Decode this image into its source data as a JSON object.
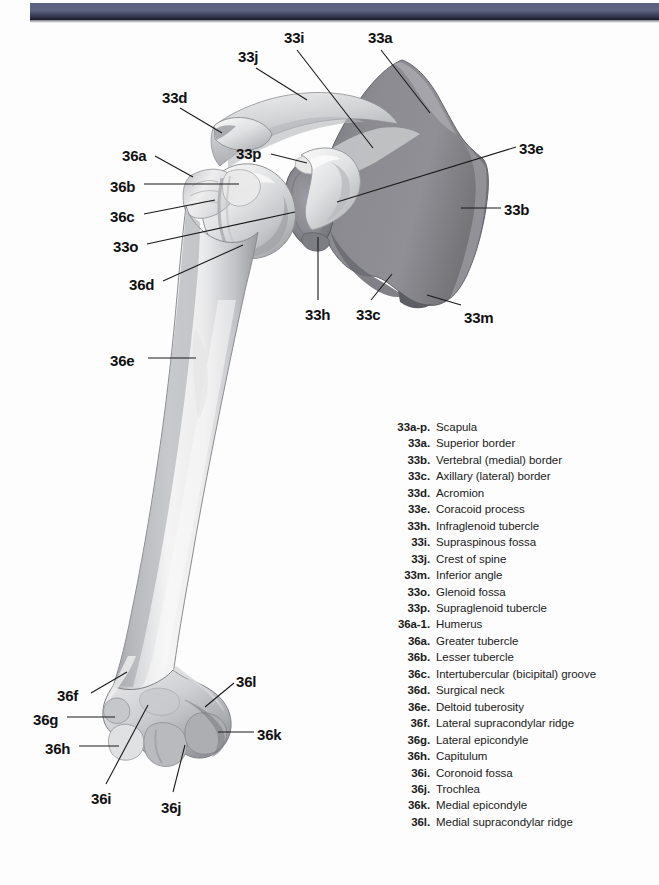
{
  "page": {
    "background_color": "#fdfdfd",
    "width": 659,
    "height": 885
  },
  "top_band": {
    "name": "decorative-header-band",
    "colors": [
      "#5b6180",
      "#3c4059",
      "#1b1d2c"
    ]
  },
  "figure": {
    "view": "Anterior view",
    "bone_colors": {
      "humerus_light": "#f2f2f2",
      "humerus_mid": "#d3d4d6",
      "humerus_shadow": "#9b9ca0",
      "scapula_body": "#86868c",
      "scapula_dark": "#6e6e76",
      "scapula_light": "#d8d8da",
      "outline": "#6a6a70"
    },
    "leader_line_color": "#1a1a1a"
  },
  "callouts": [
    {
      "code": "33i",
      "x": 284,
      "y": 30,
      "leader": [
        [
          297,
          50
        ],
        [
          373,
          148
        ]
      ]
    },
    {
      "code": "33a",
      "x": 368,
      "y": 30,
      "leader": [
        [
          381,
          50
        ],
        [
          430,
          113
        ]
      ]
    },
    {
      "code": "33j",
      "x": 238,
      "y": 49,
      "leader": [
        [
          256,
          68
        ],
        [
          307,
          100
        ]
      ]
    },
    {
      "code": "33d",
      "x": 162,
      "y": 90,
      "leader": [
        [
          180,
          108
        ],
        [
          222,
          133
        ]
      ]
    },
    {
      "code": "33e",
      "x": 519,
      "y": 141,
      "leader": [
        [
          516,
          147
        ],
        [
          337,
          202
        ]
      ]
    },
    {
      "code": "33p",
      "x": 236,
      "y": 146,
      "leader": [
        [
          271,
          154
        ],
        [
          307,
          163
        ]
      ]
    },
    {
      "code": "36a",
      "x": 122,
      "y": 148,
      "leader": [
        [
          155,
          156
        ],
        [
          193,
          177
        ]
      ]
    },
    {
      "code": "36b",
      "x": 110,
      "y": 179,
      "leader": [
        [
          144,
          184
        ],
        [
          239,
          184
        ]
      ]
    },
    {
      "code": "33b",
      "x": 504,
      "y": 202,
      "leader": [
        [
          501,
          208
        ],
        [
          461,
          208
        ]
      ]
    },
    {
      "code": "36c",
      "x": 110,
      "y": 209,
      "leader": [
        [
          144,
          214
        ],
        [
          215,
          200
        ]
      ]
    },
    {
      "code": "33o",
      "x": 113,
      "y": 239,
      "leader": [
        [
          147,
          244
        ],
        [
          295,
          212
        ]
      ]
    },
    {
      "code": "36d",
      "x": 129,
      "y": 277,
      "leader": [
        [
          163,
          281
        ],
        [
          243,
          245
        ]
      ]
    },
    {
      "code": "33h",
      "x": 305,
      "y": 307,
      "leader": [
        [
          318,
          300
        ],
        [
          318,
          237
        ]
      ]
    },
    {
      "code": "33c",
      "x": 356,
      "y": 307,
      "leader": [
        [
          371,
          300
        ],
        [
          392,
          274
        ]
      ]
    },
    {
      "code": "33m",
      "x": 464,
      "y": 310,
      "leader": [
        [
          461,
          305
        ],
        [
          427,
          295
        ]
      ]
    },
    {
      "code": "36e",
      "x": 110,
      "y": 353,
      "leader": [
        [
          148,
          358
        ],
        [
          196,
          358
        ]
      ]
    },
    {
      "code": "36l",
      "x": 236,
      "y": 674,
      "leader": [
        [
          234,
          683
        ],
        [
          205,
          707
        ]
      ]
    },
    {
      "code": "36f",
      "x": 57,
      "y": 688,
      "leader": [
        [
          91,
          693
        ],
        [
          127,
          672
        ]
      ]
    },
    {
      "code": "36g",
      "x": 33,
      "y": 712,
      "leader": [
        [
          67,
          717
        ],
        [
          115,
          717
        ]
      ]
    },
    {
      "code": "36k",
      "x": 257,
      "y": 727,
      "leader": [
        [
          254,
          732
        ],
        [
          218,
          732
        ]
      ]
    },
    {
      "code": "36h",
      "x": 45,
      "y": 741,
      "leader": [
        [
          79,
          746
        ],
        [
          119,
          746
        ]
      ]
    },
    {
      "code": "36i",
      "x": 91,
      "y": 791,
      "leader": [
        [
          106,
          784
        ],
        [
          148,
          705
        ]
      ]
    },
    {
      "code": "36j",
      "x": 161,
      "y": 800,
      "leader": [
        [
          173,
          792
        ],
        [
          185,
          745
        ]
      ]
    }
  ],
  "legend": {
    "entries": [
      {
        "code": "33a-p.",
        "term": "Scapula"
      },
      {
        "code": "33a.",
        "term": "Superior border"
      },
      {
        "code": "33b.",
        "term": "Vertebral (medial) border"
      },
      {
        "code": "33c.",
        "term": "Axillary (lateral) border"
      },
      {
        "code": "33d.",
        "term": "Acromion"
      },
      {
        "code": "33e.",
        "term": "Coracoid process"
      },
      {
        "code": "33h.",
        "term": "Infraglenoid tubercle"
      },
      {
        "code": "33i.",
        "term": "Supraspinous fossa"
      },
      {
        "code": "33j.",
        "term": "Crest of spine"
      },
      {
        "code": "33m.",
        "term": "Inferior angle"
      },
      {
        "code": "33o.",
        "term": "Glenoid fossa"
      },
      {
        "code": "33p.",
        "term": "Supraglenoid tubercle"
      },
      {
        "code": "36a-1.",
        "term": "Humerus"
      },
      {
        "code": "36a.",
        "term": "Greater tubercle"
      },
      {
        "code": "36b.",
        "term": "Lesser tubercle"
      },
      {
        "code": "36c.",
        "term": "Intertubercular (bicipital) groove"
      },
      {
        "code": "36d.",
        "term": "Surgical neck"
      },
      {
        "code": "36e.",
        "term": "Deltoid tuberosity"
      },
      {
        "code": "36f.",
        "term": "Lateral supracondylar ridge"
      },
      {
        "code": "36g.",
        "term": "Lateral epicondyle"
      },
      {
        "code": "36h.",
        "term": "Capitulum"
      },
      {
        "code": "36i.",
        "term": "Coronoid fossa"
      },
      {
        "code": "36j.",
        "term": "Trochlea"
      },
      {
        "code": "36k.",
        "term": "Medial epicondyle"
      },
      {
        "code": "36l.",
        "term": "Medial supracondylar ridge"
      }
    ]
  }
}
